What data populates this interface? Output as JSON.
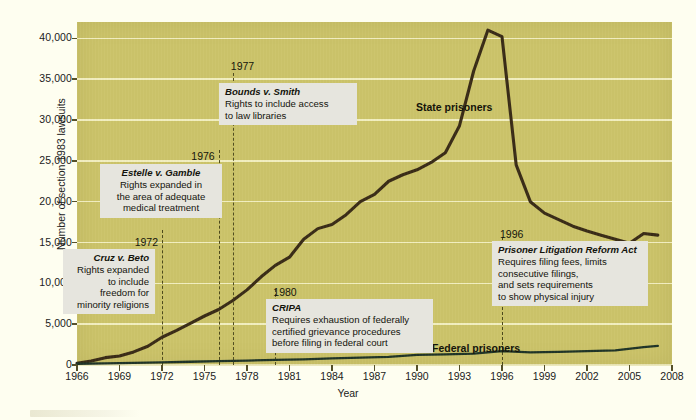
{
  "chart_data": {
    "type": "line",
    "title": "",
    "xlabel": "Year",
    "ylabel": "Number of section 1983 lawsuits",
    "xlim": [
      1966,
      2008
    ],
    "ylim": [
      0,
      42000
    ],
    "xticks": [
      1966,
      1969,
      1972,
      1975,
      1978,
      1981,
      1984,
      1987,
      1990,
      1993,
      1996,
      1999,
      2002,
      2005,
      2008
    ],
    "yticks": [
      0,
      5000,
      10000,
      15000,
      20000,
      25000,
      30000,
      35000,
      40000
    ],
    "ytick_labels": [
      "0",
      "5,000",
      "10,000",
      "15,000",
      "20,000",
      "25,000",
      "30,000",
      "35,000",
      "40,000"
    ],
    "grid": true,
    "legend_position": "inline-labels",
    "series": [
      {
        "name": "State prisoners",
        "color": "#3a2c17",
        "x": [
          1966,
          1967,
          1968,
          1969,
          1970,
          1971,
          1972,
          1973,
          1974,
          1975,
          1976,
          1977,
          1978,
          1979,
          1980,
          1981,
          1982,
          1983,
          1984,
          1985,
          1986,
          1987,
          1988,
          1989,
          1990,
          1991,
          1992,
          1993,
          1994,
          1995,
          1996,
          1997,
          1998,
          1999,
          2000,
          2001,
          2002,
          2003,
          2004,
          2005,
          2006,
          2007
        ],
        "values": [
          220,
          500,
          900,
          1100,
          1600,
          2300,
          3400,
          4200,
          5100,
          6000,
          6800,
          7900,
          9200,
          10800,
          12200,
          13200,
          15400,
          16700,
          17200,
          18400,
          20000,
          20900,
          22500,
          23300,
          23900,
          24800,
          26000,
          29300,
          36000,
          41000,
          40200,
          24500,
          20000,
          18600,
          17800,
          17000,
          16400,
          15900,
          15400,
          14900,
          16100,
          15900
        ],
        "peak_year": 1995,
        "peak_value": 41000
      },
      {
        "name": "Federal prisoners",
        "color": "#1f3427",
        "x": [
          1966,
          1968,
          1970,
          1972,
          1974,
          1976,
          1978,
          1980,
          1982,
          1984,
          1986,
          1988,
          1990,
          1992,
          1994,
          1996,
          1998,
          2000,
          2002,
          2004,
          2006,
          2007
        ],
        "values": [
          150,
          200,
          260,
          320,
          400,
          480,
          540,
          620,
          700,
          800,
          900,
          1000,
          1250,
          1300,
          1400,
          1700,
          1550,
          1600,
          1700,
          1800,
          2200,
          2350
        ]
      }
    ],
    "annotations": [
      {
        "year": 1972,
        "year_label": "1972",
        "title": "Cruz v. Beto",
        "body": "Rights expanded\nto include\nfreedom for\nminority religions",
        "align": "right"
      },
      {
        "year": 1976,
        "year_label": "1976",
        "title": "Estelle v. Gamble",
        "body": "Rights expanded in\nthe area of adequate\nmedical treatment",
        "align": "center"
      },
      {
        "year": 1977,
        "year_label": "1977",
        "title": "Bounds v. Smith",
        "body": "Rights to include access\nto law libraries",
        "align": "left"
      },
      {
        "year": 1980,
        "year_label": "1980",
        "title": "CRIPA",
        "body": "Requires exhaustion of federally\ncertified grievance procedures\nbefore filing in federal court",
        "align": "left"
      },
      {
        "year": 1996,
        "year_label": "1996",
        "title": "Prisoner Litigation Reform Act",
        "body": "Requires filing fees, limits\nconsecutive filings,\nand sets requirements\nto show physical injury",
        "align": "left"
      }
    ],
    "colors": {
      "plot_background": "#ccc46a",
      "page_background": "#fefef0",
      "gridline": "#f5f2c8",
      "state_line": "#3a2c17",
      "federal_line": "#1f3427",
      "annotation_box": "#e6e5de",
      "event_dash": "#4e4b1c",
      "text": "#14140c"
    }
  },
  "labels": {
    "state_prisoners": "State prisoners",
    "federal_prisoners": "Federal prisoners"
  }
}
